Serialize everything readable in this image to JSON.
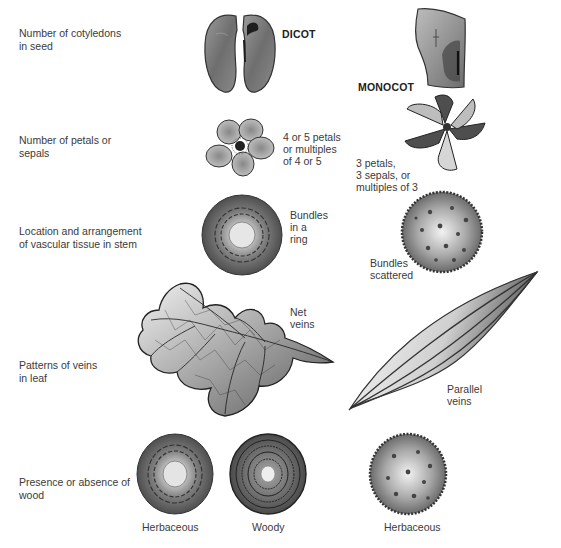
{
  "columns": {
    "dicot": "DICOT",
    "monocot": "MONOCOT"
  },
  "rows": [
    {
      "label": [
        "Number of cotyledons",
        "in seed"
      ]
    },
    {
      "label": [
        "Number of petals or",
        "sepals"
      ]
    },
    {
      "label": [
        "Location and arrangement",
        "of vascular tissue in stem"
      ]
    },
    {
      "label": [
        "Patterns of veins",
        "in leaf"
      ]
    },
    {
      "label": [
        "Presence or absence of",
        "wood"
      ]
    }
  ],
  "annotations": {
    "dicot_petals": [
      "4  or 5 petals",
      "or multiples",
      "of 4 or 5"
    ],
    "monocot_petals": [
      "3  petals,",
      "3 sepals, or",
      "multiples of 3"
    ],
    "dicot_stem": [
      "Bundles",
      "in a",
      "ring"
    ],
    "monocot_stem": [
      "Bundles",
      "scattered"
    ],
    "dicot_leaf": [
      "Net",
      "veins"
    ],
    "monocot_leaf": [
      "Parallel",
      "veins"
    ]
  },
  "captions": {
    "dicot_herbaceous": "Herbaceous",
    "dicot_woody": "Woody",
    "monocot_herbaceous": "Herbaceous"
  },
  "colors": {
    "text": "#3a3a3a",
    "illustration_dark": "#4a4a4a",
    "illustration_light": "#d8d8d8"
  }
}
